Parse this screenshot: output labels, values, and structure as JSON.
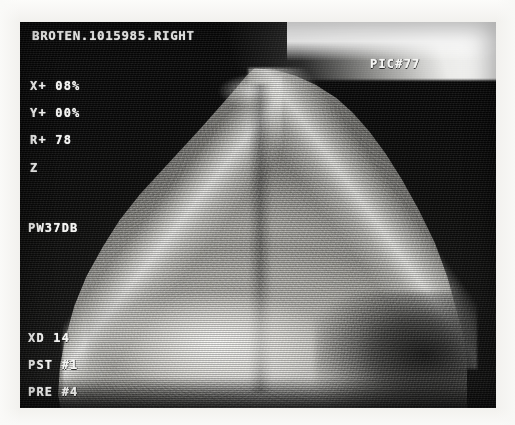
{
  "image": {
    "modality": "ultrasound",
    "kind": "scan-photograph",
    "width": 515,
    "height": 425
  },
  "scan": {
    "header_label": "BROTEN.1015985.RIGHT",
    "frame_label": "PIC#77",
    "parameters": [
      {
        "name": "x-offset",
        "label": "X+ 08%"
      },
      {
        "name": "y-offset",
        "label": "Y+ 00%"
      },
      {
        "name": "rotation",
        "label": "R+ 78"
      },
      {
        "name": "zoom-mode",
        "label": "Z"
      },
      {
        "name": "power-gain",
        "label": "PW37DB"
      },
      {
        "name": "transducer",
        "label": "XD 14"
      },
      {
        "name": "post-process",
        "label": "PST #1"
      },
      {
        "name": "pre-process",
        "label": "PRE #4"
      }
    ],
    "param_header": "BROTEN.1015985.RIGHT",
    "param_pic": "PIC#77",
    "param_x": "X+ 08%",
    "param_y": "Y+ 00%",
    "param_r": "R+ 78",
    "param_z": "Z",
    "param_pw": "PW37DB",
    "param_xd": "XD 14",
    "param_pst": "PST #1",
    "param_pre": "PRE #4"
  },
  "colors": {
    "paper": "#f6f5f2",
    "field_dark": "#0a0a0a",
    "tissue_bright": "#fcfcfa",
    "overlay_text": "#f4f4f2",
    "flare": "#ffffff"
  }
}
